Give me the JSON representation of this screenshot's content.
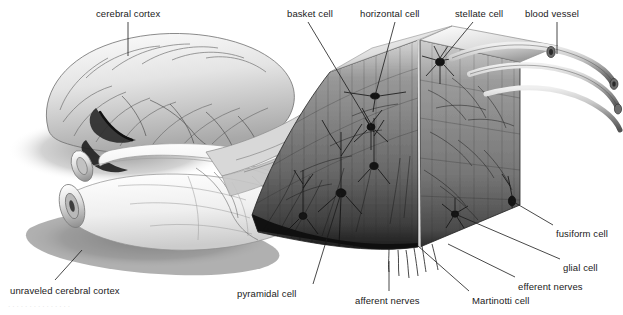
{
  "figure": {
    "background_color": "#ffffff",
    "ink_color": "#1a1a1a",
    "width": 623,
    "height": 315
  },
  "labels": [
    {
      "id": "cerebral-cortex",
      "text": "cerebral cortex",
      "x": 96,
      "y": 8,
      "anchor": "start"
    },
    {
      "id": "basket-cell",
      "text": "basket cell",
      "x": 287,
      "y": 8,
      "anchor": "start"
    },
    {
      "id": "horizontal-cell",
      "text": "horizontal cell",
      "x": 360,
      "y": 8,
      "anchor": "start"
    },
    {
      "id": "stellate-cell",
      "text": "stellate cell",
      "x": 455,
      "y": 8,
      "anchor": "start"
    },
    {
      "id": "blood-vessel",
      "text": "blood vessel",
      "x": 525,
      "y": 8,
      "anchor": "start"
    },
    {
      "id": "fusiform-cell",
      "text": "fusiform cell",
      "x": 556,
      "y": 228,
      "anchor": "start"
    },
    {
      "id": "glial-cell",
      "text": "glial cell",
      "x": 563,
      "y": 262,
      "anchor": "start"
    },
    {
      "id": "efferent-nerves",
      "text": "efferent nerves",
      "x": 518,
      "y": 281,
      "anchor": "start"
    },
    {
      "id": "martinotti-cell",
      "text": "Martinotti cell",
      "x": 472,
      "y": 295,
      "anchor": "start"
    },
    {
      "id": "afferent-nerves",
      "text": "afferent nerves",
      "x": 355,
      "y": 295,
      "anchor": "start"
    },
    {
      "id": "pyramidal-cell",
      "text": "pyramidal cell",
      "x": 237,
      "y": 288,
      "anchor": "start"
    },
    {
      "id": "unraveled-cerebral-cortex",
      "text": "unraveled cerebral cortex",
      "x": 10,
      "y": 285,
      "anchor": "start"
    }
  ],
  "leaders": [
    {
      "id": "leader-cerebral-cortex",
      "from": [
        128,
        22
      ],
      "to": [
        128,
        56
      ]
    },
    {
      "id": "leader-basket-cell",
      "from": [
        308,
        22
      ],
      "to": [
        371,
        127
      ]
    },
    {
      "id": "leader-horizontal-cell",
      "from": [
        395,
        22
      ],
      "to": [
        375,
        96
      ]
    },
    {
      "id": "leader-stellate-cell",
      "from": [
        473,
        22
      ],
      "to": [
        440,
        62
      ]
    },
    {
      "id": "leader-blood-vessel",
      "from": [
        557,
        22
      ],
      "to": [
        557,
        54
      ]
    },
    {
      "id": "leader-fusiform-cell",
      "from": [
        553,
        225
      ],
      "to": [
        512,
        201
      ]
    },
    {
      "id": "leader-glial-cell",
      "from": [
        560,
        259
      ],
      "to": [
        455,
        214
      ]
    },
    {
      "id": "leader-efferent-nerves",
      "from": [
        515,
        277
      ],
      "to": [
        448,
        244
      ]
    },
    {
      "id": "leader-martinotti-cell",
      "from": [
        469,
        291
      ],
      "to": [
        418,
        246
      ]
    },
    {
      "id": "leader-afferent-nerves",
      "from": [
        389,
        291
      ],
      "to": [
        389,
        261
      ]
    },
    {
      "id": "leader-pyramidal-cell",
      "from": [
        313,
        284
      ],
      "to": [
        341,
        193
      ]
    },
    {
      "id": "leader-unraveled-cortex",
      "from": [
        55,
        280
      ],
      "to": [
        82,
        250
      ]
    }
  ],
  "caption": {
    "text": "· · ·   · ·      · ·    · ·      · · ·       · ·        ·"
  },
  "art": {
    "brain_fill": "#e9e9e9",
    "brain_shadow": "#8c8c8c",
    "sheet_fill": "#f2f2f2",
    "slab_dark": "#3a3a3a",
    "slab_mid": "#6e6e6e",
    "slab_light": "#b6b6b6",
    "vessel_color": "#4a4a4a"
  }
}
